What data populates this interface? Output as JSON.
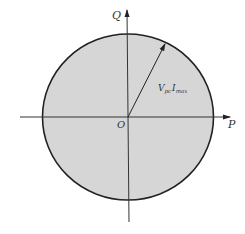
{
  "diagram": {
    "type": "PQ capability circle",
    "axes": {
      "horizontal_label": "P",
      "vertical_label": "Q",
      "origin_label": "O"
    },
    "radius_label": {
      "main": "V",
      "sub1": "pc",
      "main2": "I",
      "sub2": "max"
    },
    "colors": {
      "fill": "#d6d6d6",
      "stroke": "#222222",
      "axis": "#333333"
    }
  }
}
